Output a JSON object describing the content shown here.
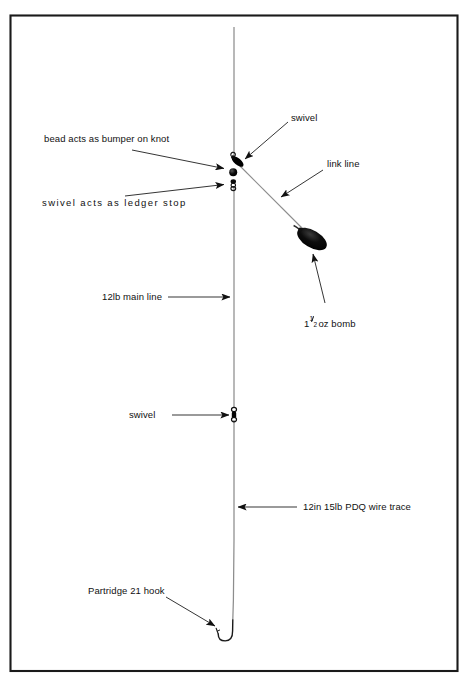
{
  "diagram": {
    "frame": {
      "left": 10,
      "top": 15,
      "right": 458,
      "bottom": 671,
      "color": "#1a1a1a"
    },
    "colors": {
      "line": "#8a8a8a",
      "ink": "#111111",
      "component_fill": "#000000",
      "frame": "#1a1a1a"
    },
    "main_line_x": 234,
    "labels": {
      "bead_bumper": "bead acts as bumper on knot",
      "swivel_ledger_stop": "swivel  acts  as  ledger  stop",
      "main_line": "12lb main line",
      "swivel_top": "swivel",
      "link_line": "link line",
      "bomb_prefix": "1",
      "bomb_num": "1",
      "bomb_den": "2",
      "bomb_suffix": "oz  bomb",
      "bomb_full": "1 1/2 oz bomb",
      "swivel_mid": "swivel",
      "wire_trace": "12in 15lb PDQ wire trace",
      "hook": "Partridge 21 hook"
    },
    "components": [
      {
        "name": "top-swivel",
        "type": "swivel",
        "x": 236,
        "y": 160
      },
      {
        "name": "bead",
        "type": "bead",
        "x": 233,
        "y": 172
      },
      {
        "name": "ledger-stop-swivel",
        "type": "swivel",
        "x": 233,
        "y": 185
      },
      {
        "name": "bomb",
        "type": "lead-weight",
        "x": 312,
        "y": 239
      },
      {
        "name": "mid-swivel",
        "type": "swivel",
        "x": 234,
        "y": 413
      },
      {
        "name": "hook",
        "type": "hook",
        "x": 234,
        "y": 625
      }
    ]
  }
}
